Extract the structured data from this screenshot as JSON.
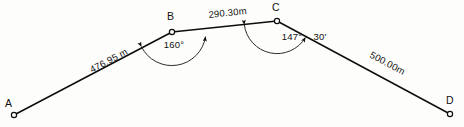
{
  "diagram": {
    "type": "surveying-traverse",
    "background_color": "#fdfdfb",
    "line_color": "#0d0d0d",
    "stations": [
      {
        "id": "A",
        "label": "A",
        "x": 14,
        "y": 115,
        "label_x": 5,
        "label_y": 107
      },
      {
        "id": "B",
        "label": "B",
        "x": 172,
        "y": 32,
        "label_x": 167,
        "label_y": 20
      },
      {
        "id": "C",
        "label": "C",
        "x": 277,
        "y": 21,
        "label_x": 272,
        "label_y": 11
      },
      {
        "id": "D",
        "label": "D",
        "x": 450,
        "y": 114,
        "label_x": 446,
        "label_y": 104
      }
    ],
    "segments": [
      {
        "id": "AB",
        "from": "A",
        "to": "B",
        "distance_label": "476.95 m",
        "label_x": 92,
        "label_y": 73,
        "label_rotation": -27.7
      },
      {
        "id": "BC",
        "from": "B",
        "to": "C",
        "distance_label": "290.30m",
        "label_x": 228,
        "label_y": 16,
        "label_rotation": -6.0
      },
      {
        "id": "CD",
        "from": "C",
        "to": "D",
        "distance_label": "500.00m",
        "label_x": 386,
        "label_y": 66,
        "label_rotation": 28.3
      }
    ],
    "angles": [
      {
        "id": "angle-B",
        "at_station": "B",
        "degrees_label": "160°",
        "minutes_label": "",
        "label_x": 174,
        "label_y": 48,
        "arc_radius": 34
      },
      {
        "id": "angle-C",
        "at_station": "C",
        "degrees_label": "147°",
        "minutes_label": "30'",
        "label_x": 279,
        "label_y": 40,
        "arc_radius": 33
      }
    ]
  }
}
